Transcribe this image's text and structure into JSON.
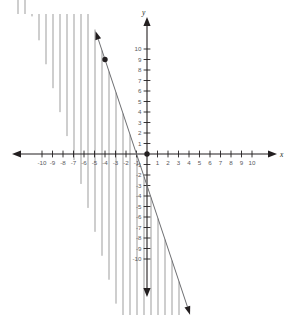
{
  "figure": {
    "name": "linear-inequality-graph",
    "width": 292,
    "height": 323,
    "background_color": "#ffffff"
  },
  "axes": {
    "x_label": "x",
    "y_label": "y",
    "axis_color": "#231f20",
    "label_color": "#58595b",
    "origin_px": {
      "x": 147,
      "y": 154
    },
    "unit_px": 10.5,
    "xlim": [
      -11.9,
      11.9
    ],
    "ylim": [
      -12.2,
      12.2
    ],
    "x_tick_labels": [
      "-10",
      "-9",
      "-8",
      "-7",
      "-6",
      "-5",
      "-4",
      "-3",
      "-2",
      "-1",
      "1",
      "2",
      "3",
      "4",
      "5",
      "6",
      "7",
      "8",
      "9",
      "10"
    ],
    "x_tick_values": [
      -10,
      -9,
      -8,
      -7,
      -6,
      -5,
      -4,
      -3,
      -2,
      -1,
      1,
      2,
      3,
      4,
      5,
      6,
      7,
      8,
      9,
      10
    ],
    "y_tick_labels": [
      "10",
      "9",
      "8",
      "7",
      "6",
      "5",
      "4",
      "3",
      "2",
      "1",
      "-1",
      "-2",
      "-3",
      "-4",
      "-5",
      "-6",
      "-7",
      "-8",
      "-9",
      "-10"
    ],
    "y_tick_values": [
      10,
      9,
      8,
      7,
      6,
      5,
      4,
      3,
      2,
      1,
      -1,
      -2,
      -3,
      -4,
      -5,
      -6,
      -7,
      -8,
      -9,
      -10
    ],
    "grid": false
  },
  "chart_data": {
    "type": "line",
    "title": "",
    "xlabel": "x",
    "ylabel": "y",
    "xlim": [
      -11.9,
      11.9
    ],
    "ylim": [
      -12.2,
      12.2
    ],
    "grid": false,
    "legend": null,
    "series": [
      {
        "name": "boundary-line",
        "type": "line",
        "style": "solid",
        "color": "#6d6e71",
        "slope": -3,
        "intercept": -3,
        "equation": "y = -3x - 3",
        "x": [
          -4.9,
          4.1
        ],
        "y": [
          11.7,
          -15.3
        ],
        "arrow_start": true,
        "arrow_end": true,
        "drawn_x_range": [
          -4.9,
          4.1
        ]
      }
    ],
    "points": [
      {
        "name": "plotted-point",
        "x": -4,
        "y": 9,
        "filled": true,
        "color": "#231f20"
      },
      {
        "name": "origin-point",
        "x": 0,
        "y": 0,
        "filled": true,
        "color": "#231f20"
      }
    ],
    "shading": {
      "name": "solution-region",
      "style": "vertical-hatch-lines",
      "color": "#8c8c8c",
      "direction": "below-boundary-line",
      "hatch_spacing_px": 7,
      "description": "Vertical line hatching filling the region below the boundary line y = -3x - 3"
    }
  }
}
